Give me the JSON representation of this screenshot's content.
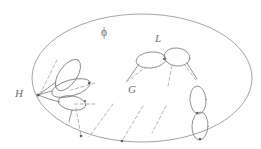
{
  "figure": {
    "type": "diagram",
    "canvas": {
      "width": 261,
      "height": 149,
      "background": "#ffffff"
    },
    "colors": {
      "ink": "#6f6f74",
      "outer_boundary": "#8b8b90",
      "dashed": "#9a9a9e",
      "node": "#5d5d62",
      "label": "#6b6b70"
    }
  },
  "labels": [
    {
      "id": "phi",
      "text": "ϕ",
      "x": 101,
      "y": 27,
      "style": "greek",
      "meaning": "outer-region-label"
    },
    {
      "id": "ell",
      "text": "L",
      "x": 155,
      "y": 33,
      "style": "italic",
      "meaning": "upper-cluster-label"
    },
    {
      "id": "gee",
      "text": "G",
      "x": 128,
      "y": 84,
      "style": "italic",
      "meaning": "interior-label"
    },
    {
      "id": "aitch",
      "text": "H",
      "x": 15,
      "y": 88,
      "style": "italic",
      "meaning": "left-basepoint-label"
    }
  ],
  "outer_region": {
    "name": "phi-region",
    "shape": "ellipse",
    "cx": 142,
    "cy": 78,
    "rx": 110,
    "ry": 64
  },
  "clusters": [
    {
      "id": "h-cluster",
      "label": "H",
      "basepoint": {
        "x": 38,
        "y": 95
      },
      "loops": [
        {
          "id": "h-loop-upper",
          "cx": 68,
          "cy": 75,
          "rx": 18,
          "ry": 9,
          "rotation": -55
        },
        {
          "id": "h-loop-middle",
          "cx": 71,
          "cy": 88,
          "rx": 20,
          "ry": 8,
          "rotation": -16
        },
        {
          "id": "h-loop-lower",
          "cx": 72,
          "cy": 103,
          "rx": 14,
          "ry": 7,
          "rotation": 10
        }
      ]
    },
    {
      "id": "l-cluster",
      "label": "L",
      "loops": [
        {
          "id": "l-loop-left",
          "cx": 151,
          "cy": 60,
          "rx": 15,
          "ry": 8,
          "rotation": -6
        },
        {
          "id": "l-loop-right",
          "cx": 177,
          "cy": 57,
          "rx": 13,
          "ry": 9,
          "rotation": 6
        }
      ]
    },
    {
      "id": "r-cluster",
      "label": "",
      "loops": [
        {
          "id": "r-loop-top",
          "cx": 198,
          "cy": 100,
          "rx": 8,
          "ry": 14,
          "rotation": -4
        },
        {
          "id": "r-loop-bottom",
          "cx": 200,
          "cy": 126,
          "rx": 8,
          "ry": 14,
          "rotation": 3
        }
      ]
    }
  ],
  "dashed_rays": [
    {
      "id": "ray-h-up",
      "x1": 57,
      "y1": 60,
      "x2": 41,
      "y2": 92
    },
    {
      "id": "ray-h-right",
      "x1": 95,
      "y1": 83,
      "x2": 71,
      "y2": 90
    },
    {
      "id": "ray-h-low",
      "x1": 95,
      "y1": 104,
      "x2": 72,
      "y2": 104
    },
    {
      "id": "ray-h-down",
      "x1": 76,
      "y1": 108,
      "x2": 81,
      "y2": 136
    },
    {
      "id": "ray-mid-a",
      "x1": 113,
      "y1": 104,
      "x2": 89,
      "y2": 137
    },
    {
      "id": "ray-mid-b",
      "x1": 143,
      "y1": 106,
      "x2": 122,
      "y2": 141
    },
    {
      "id": "ray-l-left",
      "x1": 126,
      "y1": 82,
      "x2": 146,
      "y2": 67
    },
    {
      "id": "ray-l-mid",
      "x1": 168,
      "y1": 86,
      "x2": 172,
      "y2": 66
    },
    {
      "id": "ray-l-right",
      "x1": 196,
      "y1": 80,
      "x2": 184,
      "y2": 64
    },
    {
      "id": "ray-right-b",
      "x1": 166,
      "y1": 106,
      "x2": 152,
      "y2": 133
    }
  ],
  "boundary_nodes": [
    {
      "id": "node-basepoint",
      "x": 38,
      "y": 95
    },
    {
      "id": "node-bottom-1",
      "x": 81,
      "y": 136
    },
    {
      "id": "node-bottom-2",
      "x": 122,
      "y": 141
    },
    {
      "id": "node-right-mid",
      "x": 196,
      "y": 113
    },
    {
      "id": "node-right-low",
      "x": 200,
      "y": 139
    }
  ]
}
